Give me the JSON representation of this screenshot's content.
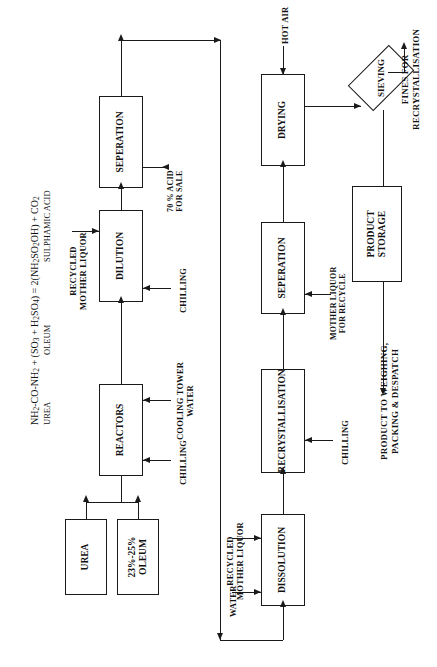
{
  "diagram": {
    "orientation": "rotated-90",
    "equation": {
      "line1_html": "NH<sub>2</sub>-CO-NH<sub>2</sub> + (SO<sub>3</sub> + H<sub>2</sub>SO<sub>4</sub>) = 2(NH<sub>2</sub>SO<sub>2</sub>OH) + CO<sub>2</sub>",
      "line1_text": "NH2-CO-NH2 + (SO3 + H2SO4) = 2(NH2 SO2OH) + CO2",
      "reactant_label_1": "UREA",
      "reactant_label_2": "OLEUM",
      "product_label": "SULPHAMIC ACID"
    },
    "nodes": [
      {
        "id": "urea",
        "label": "UREA",
        "shape": "rect"
      },
      {
        "id": "oleum",
        "label": "23%-25%\nOLEUM",
        "shape": "rect",
        "line1": "23%-25%",
        "line2": "OLEUM"
      },
      {
        "id": "reactors",
        "label": "REACTORS",
        "shape": "rect"
      },
      {
        "id": "dilution",
        "label": "DILUTION",
        "shape": "rect"
      },
      {
        "id": "seperation1",
        "label": "SEPERATION",
        "shape": "rect"
      },
      {
        "id": "dissolution",
        "label": "DISSOLUTION",
        "shape": "rect"
      },
      {
        "id": "recrystallisation",
        "label": "RECRYSTALLISATION",
        "shape": "rect"
      },
      {
        "id": "seperation2",
        "label": "SEPERATION",
        "shape": "rect"
      },
      {
        "id": "drying",
        "label": "DRYING",
        "shape": "rect"
      },
      {
        "id": "sieving",
        "label": "SIEVING",
        "shape": "diamond"
      },
      {
        "id": "product_storage",
        "label": "PRODUCT\nSTORAGE",
        "shape": "rect",
        "line1": "PRODUCT",
        "line2": "STORAGE"
      }
    ],
    "stream_labels": {
      "chilling_reactors": "CHILLING",
      "cooling_tower_water": "COOLING TOWER\nWATER",
      "cooling_tower_water_l1": "COOLING TOWER",
      "cooling_tower_water_l2": "WATER",
      "chilling_dilution": "CHILLING",
      "recycled_mother_liquor_top": "RECYCLED\nMOTHER LIQUOR",
      "recycled_mother_liquor_top_l1": "RECYCLED",
      "recycled_mother_liquor_top_l2": "MOTHER LIQUOR",
      "acid_for_sale": "70 % ACID\nFOR SALE",
      "acid_for_sale_l1": "70 % ACID",
      "acid_for_sale_l2": "FOR SALE",
      "water": "WATER",
      "recycled_mother_liquor_bottom": "RECYCLED\nMOTHER LIQUOR",
      "recycled_mother_liquor_bottom_l1": "RECYCLED",
      "recycled_mother_liquor_bottom_l2": "MOTHER LIQUOR",
      "chilling_recrystallisation": "CHILLING",
      "mother_liquor_for_recycle": "MOTHER LIQUOR\nFOR RECYCLE",
      "mother_liquor_for_recycle_l1": "MOTHER LIQUOR",
      "mother_liquor_for_recycle_l2": "FOR RECYCLE",
      "hot_air": "HOT AIR",
      "fines_for_recrystallisation": "FINES FOR\nRECRYSTALLISATION",
      "fines_l1": "FINES FOR",
      "fines_l2": "RECRYSTALLISATION",
      "product_despatch": "PRODUCT TO WEIGHING,\nPACKING & DESPATCH",
      "product_despatch_l1": "PRODUCT TO WEIGHING,",
      "product_despatch_l2": "PACKING & DESPATCH"
    },
    "colors": {
      "ink": "#1a1a1a",
      "background": "#ffffff"
    }
  }
}
